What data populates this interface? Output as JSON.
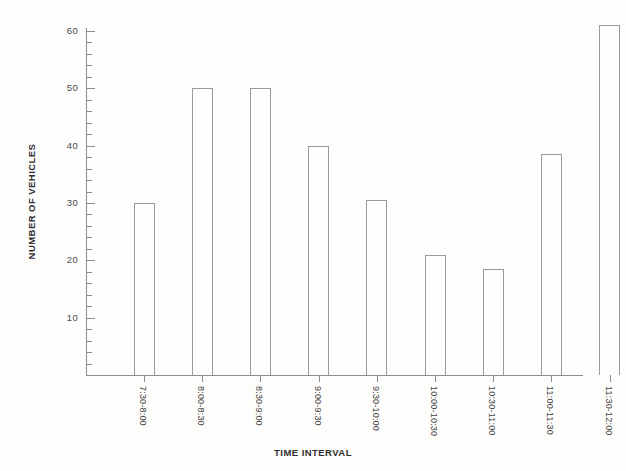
{
  "chart_data": {
    "type": "bar",
    "title": "",
    "xlabel": "TIME INTERVAL",
    "ylabel": "NUMBER OF VEHICLES",
    "categories": [
      "7:30-8:00",
      "8:00-8:30",
      "8:30-9:00",
      "9:00-9:30",
      "9:30-10:00",
      "10:00-10:30",
      "10:30-11:00",
      "11:00-11:30",
      "11:30-12:00"
    ],
    "values": [
      30,
      50,
      50,
      40,
      30.5,
      21,
      18.5,
      38.5,
      61
    ],
    "ylim": [
      0,
      62
    ],
    "xlim_label_count": 9,
    "y_major_ticks": [
      10,
      20,
      30,
      40,
      50,
      60
    ],
    "y_tick_labels": [
      "10",
      "20",
      "30",
      "40",
      "50",
      "60"
    ],
    "y_minor_tick_step": 2,
    "grid": false,
    "legend": "none",
    "bar_style": "outlined-unfilled",
    "colors": {
      "background": "#fdfdfb",
      "axis": "#8d8d8d",
      "bar_outline": "#9a9a9a",
      "bar_fill": "transparent",
      "tick_label": "#4a4a4a",
      "axis_title": "#2e2e2e"
    }
  }
}
